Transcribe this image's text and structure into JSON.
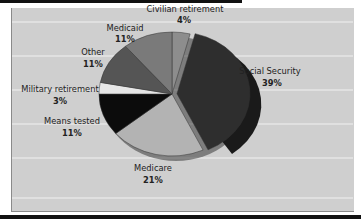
{
  "chart_data": {
    "type": "pie",
    "title": "",
    "start_angle_deg": 0,
    "direction": "clockwise",
    "exploded": "Social Security",
    "grid": true,
    "legend": "none (labels placed beside slices)",
    "slices": [
      {
        "label": "Civilian retirement",
        "value": 4,
        "value_label": "4%",
        "color": "#8d8d8d"
      },
      {
        "label": "Social Security",
        "value": 39,
        "value_label": "39%",
        "color": "#2e2e2e"
      },
      {
        "label": "Medicare",
        "value": 21,
        "value_label": "21%",
        "color": "#b3b3b3"
      },
      {
        "label": "Means tested",
        "value": 11,
        "value_label": "11%",
        "color": "#0c0c0c"
      },
      {
        "label": "Military retirement",
        "value": 3,
        "value_label": "3%",
        "color": "#e6e6e6"
      },
      {
        "label": "Other",
        "value": 11,
        "value_label": "11%",
        "color": "#555555"
      },
      {
        "label": "Medicaid",
        "value": 11,
        "value_label": "11%",
        "color": "#7a7a7a"
      }
    ]
  },
  "labels": {
    "civilian": {
      "name": "Civilian retirement",
      "pct": "4%"
    },
    "social": {
      "name": "Social Security",
      "pct": "39%"
    },
    "medicare": {
      "name": "Medicare",
      "pct": "21%"
    },
    "means": {
      "name": "Means tested",
      "pct": "11%"
    },
    "military": {
      "name": "Military retirement",
      "pct": "3%"
    },
    "other": {
      "name": "Other",
      "pct": "11%"
    },
    "medicaid": {
      "name": "Medicaid",
      "pct": "11%"
    }
  }
}
